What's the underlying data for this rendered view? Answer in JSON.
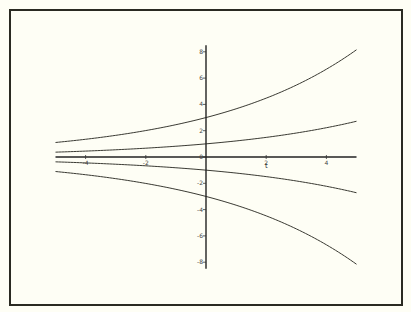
{
  "chart_data": {
    "type": "line",
    "title": "",
    "xlabel": "t",
    "ylabel": "",
    "xlim": [
      -5,
      5
    ],
    "ylim": [
      -8.5,
      8.5
    ],
    "grid": false,
    "legend": null,
    "x_ticks": [
      -4,
      -2,
      0,
      2,
      4
    ],
    "y_ticks": [
      -8,
      -6,
      -4,
      -2,
      0,
      2,
      4,
      6,
      8
    ],
    "x_tick_labels": [
      "-4",
      "-2",
      "0",
      "2",
      "4"
    ],
    "y_tick_labels": [
      "-8",
      "-6",
      "-4",
      "-2",
      "0",
      "2",
      "4",
      "6",
      "8"
    ],
    "series": [
      {
        "name": "C=3",
        "x": [
          -5,
          -2.5,
          0,
          2.5,
          5
        ],
        "values": [
          1.1,
          1.82,
          3.0,
          4.95,
          8.15
        ]
      },
      {
        "name": "C=1",
        "x": [
          -5,
          -2.5,
          0,
          2.5,
          5
        ],
        "values": [
          0.37,
          0.61,
          1.0,
          1.65,
          2.72
        ]
      },
      {
        "name": "C=0",
        "x": [
          -5,
          -2.5,
          0,
          2.5,
          5
        ],
        "values": [
          0,
          0,
          0,
          0,
          0
        ]
      },
      {
        "name": "C=-1",
        "x": [
          -5,
          -2.5,
          0,
          2.5,
          5
        ],
        "values": [
          -0.37,
          -0.61,
          -1.0,
          -1.65,
          -2.72
        ]
      },
      {
        "name": "C=-3",
        "x": [
          -5,
          -2.5,
          0,
          2.5,
          5
        ],
        "values": [
          -1.1,
          -1.82,
          -3.0,
          -4.95,
          -8.15
        ]
      }
    ],
    "curve_model": {
      "rate": 0.2,
      "constants": [
        3,
        1,
        0,
        -1,
        -3
      ]
    },
    "colors": {
      "background": "#fefef5",
      "line": "#3a3a33",
      "frame": "#2a2a22"
    }
  },
  "axes": {
    "x_label": "t"
  }
}
